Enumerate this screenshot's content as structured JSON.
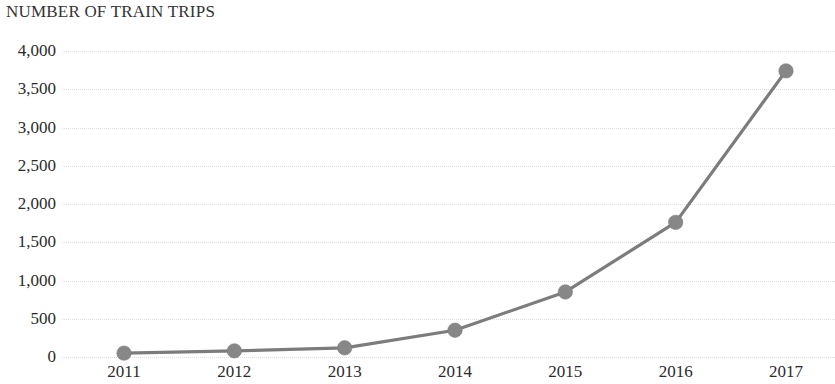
{
  "chart_data": {
    "type": "line",
    "title": "NUMBER OF TRAIN TRIPS",
    "xlabel": "",
    "ylabel": "",
    "categories": [
      "2011",
      "2012",
      "2013",
      "2014",
      "2015",
      "2016",
      "2017"
    ],
    "values": [
      50,
      80,
      120,
      350,
      850,
      1760,
      3740
    ],
    "series": [
      {
        "name": "Number of train trips",
        "values": [
          50,
          80,
          120,
          350,
          850,
          1760,
          3740
        ]
      }
    ],
    "ylim": [
      0,
      4000
    ],
    "y_tick_values": [
      0,
      500,
      1000,
      1500,
      2000,
      2500,
      3000,
      3500,
      4000
    ],
    "y_tick_labels": [
      "0",
      "500",
      "1,000",
      "1,500",
      "2,000",
      "2,500",
      "3,000",
      "3,500",
      "4,000"
    ],
    "x_tick_labels": [
      "2011",
      "2012",
      "2013",
      "2014",
      "2015",
      "2016",
      "2017"
    ],
    "grid": true,
    "grid_style": "dotted-horizontal",
    "legend": "none",
    "marker": "circle",
    "colors": {
      "line": "#7c7c7c",
      "marker": "#878787",
      "gridline": "#dedede",
      "text": "#2b2b2b",
      "title": "#333333",
      "background": "#ffffff"
    }
  }
}
